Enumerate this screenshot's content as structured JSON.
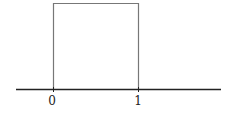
{
  "diagram": {
    "type": "uniform-distribution-box",
    "axis": {
      "tick_labels": [
        "0",
        "1"
      ]
    },
    "colors": {
      "box": "#777777",
      "axis": "#222222"
    }
  }
}
